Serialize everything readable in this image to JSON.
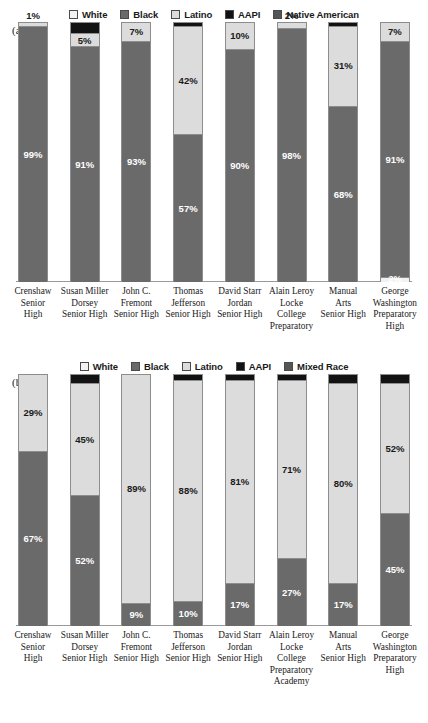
{
  "chart_data": [
    {
      "type": "bar",
      "id": "panel-a",
      "panel_tag": "(a)",
      "title": "",
      "subtitle": "",
      "xlabel": "",
      "ylabel": "",
      "ylim": [
        0,
        100
      ],
      "grid": false,
      "legend_position": "top-center",
      "stacked": true,
      "legend": [
        {
          "name": "White",
          "color": "#f2f2f2"
        },
        {
          "name": "Black",
          "color": "#6a6a6a"
        },
        {
          "name": "Latino",
          "color": "#dcdcdc"
        },
        {
          "name": "AAPI",
          "color": "#121212"
        },
        {
          "name": "Native American",
          "color": "#555555"
        }
      ],
      "categories": [
        "Crenshaw Senior High",
        "Susan Miller Dorsey Senior High",
        "John C. Fremont Senior High",
        "Thomas Jefferson Senior High",
        "David Starr Jordan Senior High",
        "Alain Leroy Locke College Preparatory",
        "Manual Arts Senior High",
        "George Washington Preparatory High"
      ],
      "category_lines": [
        [
          "Crenshaw",
          "Senior",
          "High"
        ],
        [
          "Susan Miller",
          "Dorsey",
          "Senior High"
        ],
        [
          "John C.",
          "Fremont",
          "Senior High"
        ],
        [
          "Thomas",
          "Jefferson",
          "Senior High"
        ],
        [
          "David Starr",
          "Jordan",
          "Senior High"
        ],
        [
          "Alain Leroy",
          "Locke",
          "College",
          "Preparatory"
        ],
        [
          "Manual",
          "Arts",
          "Senior High"
        ],
        [
          "George",
          "Washington",
          "Preparatory",
          "High"
        ]
      ],
      "series": [
        {
          "name": "AAPI",
          "values": [
            0,
            4,
            0,
            1,
            0,
            0,
            1,
            0
          ]
        },
        {
          "name": "Latino",
          "values": [
            1,
            5,
            7,
            42,
            10,
            2,
            31,
            7
          ]
        },
        {
          "name": "Black",
          "values": [
            99,
            91,
            93,
            57,
            90,
            98,
            68,
            91
          ]
        },
        {
          "name": "White",
          "values": [
            0,
            0,
            0,
            0,
            0,
            0,
            0,
            2
          ]
        }
      ],
      "bars": [
        {
          "segments": [
            {
              "series": "Latino",
              "value": 1,
              "label": "1%",
              "label_pos": "above"
            },
            {
              "series": "Black",
              "value": 99,
              "label": "99%",
              "label_pos": "inside"
            }
          ]
        },
        {
          "segments": [
            {
              "series": "AAPI",
              "value": 4,
              "label": "",
              "label_pos": "none"
            },
            {
              "series": "Latino",
              "value": 5,
              "label": "5%",
              "label_pos": "inside"
            },
            {
              "series": "Black",
              "value": 91,
              "label": "91%",
              "label_pos": "inside"
            }
          ]
        },
        {
          "segments": [
            {
              "series": "Latino",
              "value": 7,
              "label": "7%",
              "label_pos": "inside"
            },
            {
              "series": "Black",
              "value": 93,
              "label": "93%",
              "label_pos": "inside"
            }
          ]
        },
        {
          "segments": [
            {
              "series": "AAPI",
              "value": 1,
              "label": "",
              "label_pos": "none"
            },
            {
              "series": "Latino",
              "value": 42,
              "label": "42%",
              "label_pos": "inside"
            },
            {
              "series": "Black",
              "value": 57,
              "label": "57%",
              "label_pos": "inside"
            }
          ]
        },
        {
          "segments": [
            {
              "series": "Latino",
              "value": 10,
              "label": "10%",
              "label_pos": "inside"
            },
            {
              "series": "Black",
              "value": 90,
              "label": "90%",
              "label_pos": "inside"
            }
          ]
        },
        {
          "segments": [
            {
              "series": "Latino",
              "value": 2,
              "label": "2%",
              "label_pos": "above"
            },
            {
              "series": "Black",
              "value": 98,
              "label": "98%",
              "label_pos": "inside"
            }
          ]
        },
        {
          "segments": [
            {
              "series": "AAPI",
              "value": 1,
              "label": "",
              "label_pos": "none"
            },
            {
              "series": "Latino",
              "value": 31,
              "label": "31%",
              "label_pos": "inside"
            },
            {
              "series": "Black",
              "value": 68,
              "label": "68%",
              "label_pos": "inside"
            }
          ]
        },
        {
          "segments": [
            {
              "series": "Latino",
              "value": 7,
              "label": "7%",
              "label_pos": "inside"
            },
            {
              "series": "Black",
              "value": 91,
              "label": "91%",
              "label_pos": "inside"
            },
            {
              "series": "White",
              "value": 2,
              "label": "2%",
              "label_pos": "below"
            }
          ]
        }
      ]
    },
    {
      "type": "bar",
      "id": "panel-b",
      "panel_tag": "(b)",
      "title": "",
      "subtitle": "",
      "xlabel": "",
      "ylabel": "",
      "ylim": [
        0,
        100
      ],
      "grid": false,
      "legend_position": "top-center",
      "stacked": true,
      "legend": [
        {
          "name": "White",
          "color": "#f2f2f2"
        },
        {
          "name": "Black",
          "color": "#6a6a6a"
        },
        {
          "name": "Latino",
          "color": "#dcdcdc"
        },
        {
          "name": "AAPI",
          "color": "#121212"
        },
        {
          "name": "Mixed Race",
          "color": "#555555"
        }
      ],
      "categories": [
        "Crenshaw Senior High",
        "Susan Miller Dorsey Senior High",
        "John C. Fremont Senior High",
        "Thomas Jefferson Senior High",
        "David Starr Jordan Senior High",
        "Alain Leroy Locke College Preparatory Academy",
        "Manual Arts Senior High",
        "George Washington Preparatory High"
      ],
      "category_lines": [
        [
          "Crenshaw",
          "Senior",
          "High"
        ],
        [
          "Susan Miller",
          "Dorsey",
          "Senior High"
        ],
        [
          "John C.",
          "Fremont",
          "Senior High"
        ],
        [
          "Thomas",
          "Jefferson",
          "Senior High"
        ],
        [
          "David Starr",
          "Jordan",
          "Senior High"
        ],
        [
          "Alain Leroy",
          "Locke",
          "College",
          "Preparatory",
          "Academy"
        ],
        [
          "Manual",
          "Arts",
          "Senior High"
        ],
        [
          "George",
          "Washington",
          "Preparatory",
          "High"
        ]
      ],
      "series": [
        {
          "name": "AAPI",
          "values": [
            0,
            3,
            0,
            2,
            2,
            2,
            3,
            3
          ]
        },
        {
          "name": "Latino",
          "values": [
            29,
            45,
            89,
            88,
            81,
            71,
            80,
            52
          ]
        },
        {
          "name": "Black",
          "values": [
            67,
            52,
            9,
            10,
            17,
            27,
            17,
            45
          ]
        }
      ],
      "bars": [
        {
          "segments": [
            {
              "series": "Latino",
              "value": 29,
              "label": "29%",
              "label_pos": "inside"
            },
            {
              "series": "Black",
              "value": 67,
              "label": "67%",
              "label_pos": "inside"
            }
          ]
        },
        {
          "segments": [
            {
              "series": "AAPI",
              "value": 3,
              "label": "",
              "label_pos": "none"
            },
            {
              "series": "Latino",
              "value": 45,
              "label": "45%",
              "label_pos": "inside"
            },
            {
              "series": "Black",
              "value": 52,
              "label": "52%",
              "label_pos": "inside"
            }
          ]
        },
        {
          "segments": [
            {
              "series": "Latino",
              "value": 89,
              "label": "89%",
              "label_pos": "inside"
            },
            {
              "series": "Black",
              "value": 9,
              "label": "9%",
              "label_pos": "inside"
            }
          ]
        },
        {
          "segments": [
            {
              "series": "AAPI",
              "value": 2,
              "label": "",
              "label_pos": "none"
            },
            {
              "series": "Latino",
              "value": 88,
              "label": "88%",
              "label_pos": "inside"
            },
            {
              "series": "Black",
              "value": 10,
              "label": "10%",
              "label_pos": "inside"
            }
          ]
        },
        {
          "segments": [
            {
              "series": "AAPI",
              "value": 2,
              "label": "",
              "label_pos": "none"
            },
            {
              "series": "Latino",
              "value": 81,
              "label": "81%",
              "label_pos": "inside"
            },
            {
              "series": "Black",
              "value": 17,
              "label": "17%",
              "label_pos": "inside"
            }
          ]
        },
        {
          "segments": [
            {
              "series": "AAPI",
              "value": 2,
              "label": "",
              "label_pos": "none"
            },
            {
              "series": "Latino",
              "value": 71,
              "label": "71%",
              "label_pos": "inside"
            },
            {
              "series": "Black",
              "value": 27,
              "label": "27%",
              "label_pos": "inside"
            }
          ]
        },
        {
          "segments": [
            {
              "series": "AAPI",
              "value": 3,
              "label": "",
              "label_pos": "none"
            },
            {
              "series": "Latino",
              "value": 80,
              "label": "80%",
              "label_pos": "inside"
            },
            {
              "series": "Black",
              "value": 17,
              "label": "17%",
              "label_pos": "inside"
            }
          ]
        },
        {
          "segments": [
            {
              "series": "AAPI",
              "value": 3,
              "label": "",
              "label_pos": "none"
            },
            {
              "series": "Latino",
              "value": 52,
              "label": "52%",
              "label_pos": "inside"
            },
            {
              "series": "Black",
              "value": 45,
              "label": "45%",
              "label_pos": "inside"
            }
          ]
        }
      ]
    }
  ]
}
